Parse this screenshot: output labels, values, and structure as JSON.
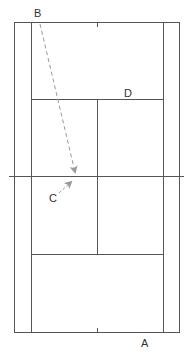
{
  "diagram": {
    "type": "tennis-court-top-view",
    "labels": {
      "A": "A",
      "B": "B",
      "C": "C",
      "D": "D"
    },
    "colors": {
      "court_line": "#555555",
      "path_line": "#999999",
      "label": "#333333"
    },
    "paths": [
      {
        "from": "B",
        "to": "net-point-near-C",
        "style": "dashed"
      },
      {
        "from": "C",
        "to": "net-point",
        "style": "dashed"
      }
    ]
  }
}
